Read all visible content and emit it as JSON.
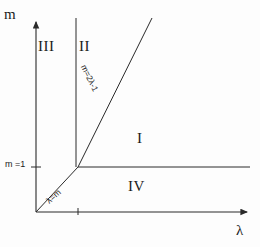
{
  "figure": {
    "kind": "phase-diagram",
    "background_color": "#fdfdfd",
    "ink_color": "#2a2a2a"
  },
  "axes": {
    "y_axis_label": "m",
    "x_axis_label": "λ",
    "y_tick_label": "m =1",
    "y_tick_value": 1,
    "origin_label": ""
  },
  "curves": [
    {
      "id": "m-eq-2lambda-minus-1",
      "label": "m=2λ-1",
      "kind": "line"
    },
    {
      "id": "lambda-eq-m",
      "label": "λ=m",
      "kind": "line"
    },
    {
      "id": "vertical-divider",
      "label": "",
      "kind": "line"
    },
    {
      "id": "m-eq-1-horizontal",
      "label": "",
      "kind": "line"
    }
  ],
  "regions": [
    {
      "id": "region-one",
      "label": "I"
    },
    {
      "id": "region-two",
      "label": "II"
    },
    {
      "id": "region-three",
      "label": "III"
    },
    {
      "id": "region-four",
      "label": "IV"
    }
  ]
}
